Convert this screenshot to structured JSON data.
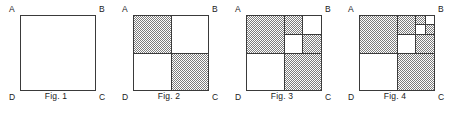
{
  "diagram": {
    "background_color": "#ffffff",
    "stroke_color": "#3a3a3a",
    "fill_pattern_color": "#8c8c8c",
    "fill_white": "#ffffff",
    "corner_labels": {
      "top_left": "A",
      "top_right": "B",
      "bottom_right": "C",
      "bottom_left": "D"
    },
    "figures": [
      {
        "caption": "Fig. 1",
        "depth": 0,
        "description": "empty square ABCD with no subdivision",
        "shaded_cells": []
      },
      {
        "caption": "Fig. 2",
        "depth": 1,
        "description": "square divided into 2x2 quadrants, top-left and bottom-right shaded",
        "shaded_cells": [
          "top-left",
          "bottom-right"
        ]
      },
      {
        "caption": "Fig. 3",
        "depth": 2,
        "description": "top-right quadrant subdivided into 2x2, its top-left and bottom-right shaded",
        "shaded_cells": [
          "top-left",
          "bottom-right",
          "tr.top-left",
          "tr.bottom-right"
        ]
      },
      {
        "caption": "Fig. 4",
        "depth": 3,
        "description": "top-right of the top-right quadrant subdivided again into 2x2, its top-left and bottom-right shaded",
        "shaded_cells": [
          "top-left",
          "bottom-right",
          "tr.top-left",
          "tr.bottom-right",
          "tr.tr.top-left",
          "tr.tr.bottom-right"
        ]
      }
    ]
  }
}
